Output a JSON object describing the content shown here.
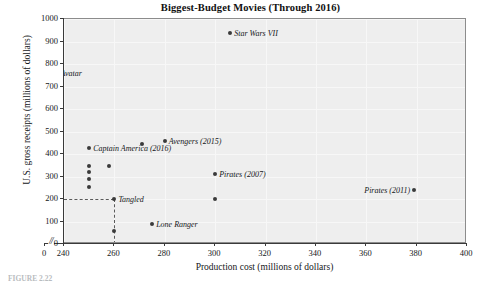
{
  "chart_data": {
    "type": "scatter",
    "title": "Biggest-Budget Movies (Through 2016)",
    "xlabel": "Production cost (millions of dollars)",
    "ylabel": "U.S. gross receipts (millions of dollars)",
    "xlim": [
      240,
      400
    ],
    "ylim": [
      0,
      1000
    ],
    "x_ticks": [
      0,
      240,
      260,
      280,
      300,
      320,
      340,
      360,
      380,
      400
    ],
    "x_tick_labels": [
      "0",
      "240",
      "260",
      "280",
      "300",
      "320",
      "340",
      "360",
      "380",
      "400"
    ],
    "y_ticks": [
      0,
      100,
      200,
      300,
      400,
      500,
      600,
      700,
      800,
      900,
      1000
    ],
    "y_tick_labels": [
      "0",
      "100",
      "200",
      "300",
      "400",
      "500",
      "600",
      "700",
      "800",
      "900",
      "1000"
    ],
    "axis_break": "//",
    "axis_break_note": "x-axis broken between 0 and 240",
    "grid": true,
    "legend": "none",
    "guides": [
      {
        "type": "horizontal",
        "y": 200,
        "style": "dashed"
      },
      {
        "type": "vertical",
        "x": 260,
        "style": "dashed"
      }
    ],
    "points": [
      {
        "label": "Star Wars VII",
        "x": 306,
        "y": 937,
        "label_pos": "right"
      },
      {
        "label": "Avatar",
        "x": 237,
        "y": 761,
        "label_pos": "right"
      },
      {
        "label": "Avengers (2015)",
        "x": 280,
        "y": 459,
        "label_pos": "right"
      },
      {
        "label": "",
        "x": 271,
        "y": 445,
        "label_pos": "right"
      },
      {
        "label": "Captain America (2016)",
        "x": 250,
        "y": 425,
        "label_pos": "right"
      },
      {
        "label": "",
        "x": 250,
        "y": 346,
        "label_pos": "right"
      },
      {
        "label": "",
        "x": 258,
        "y": 346,
        "label_pos": "right"
      },
      {
        "label": "",
        "x": 250,
        "y": 318,
        "label_pos": "right"
      },
      {
        "label": "",
        "x": 250,
        "y": 291,
        "label_pos": "right"
      },
      {
        "label": "",
        "x": 250,
        "y": 255,
        "label_pos": "right"
      },
      {
        "label": "Pirates (2007)",
        "x": 300,
        "y": 309,
        "label_pos": "right"
      },
      {
        "label": "Tangled",
        "x": 260,
        "y": 201,
        "label_pos": "right"
      },
      {
        "label": "",
        "x": 300,
        "y": 201,
        "label_pos": "right"
      },
      {
        "label": "Pirates (2011)",
        "x": 379,
        "y": 241,
        "label_pos": "left"
      },
      {
        "label": "Lone Ranger",
        "x": 275,
        "y": 89,
        "label_pos": "right"
      },
      {
        "label": "",
        "x": 260,
        "y": 60,
        "label_pos": "right"
      }
    ],
    "colors": {
      "plot_background": "#eeeeee",
      "marker": "#3a3a3a",
      "axis": "#3a3a3a",
      "text": "#15171a",
      "grid": "#f7f7f7",
      "guide": "#5a5a5a"
    }
  },
  "caption": {
    "text": "FIGURE 2.22"
  }
}
